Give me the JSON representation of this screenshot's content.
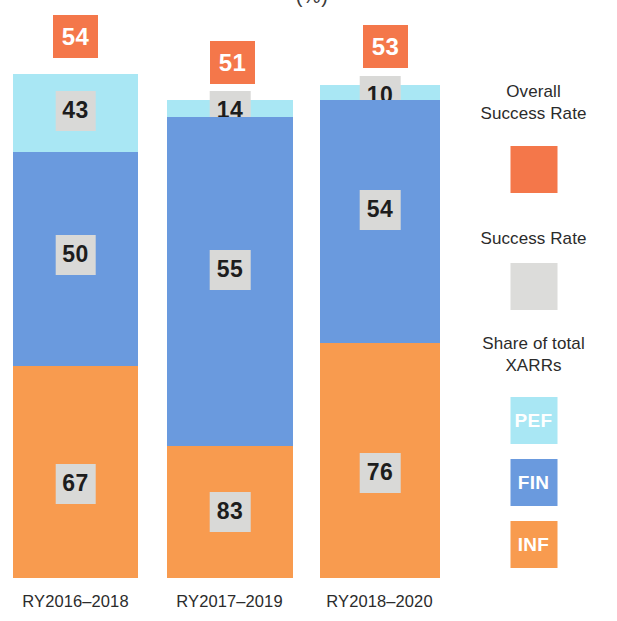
{
  "chart_data": {
    "type": "bar",
    "title": "(%)",
    "subtitle": "",
    "xlabel": "",
    "ylabel": "",
    "stacked": false,
    "grid": false,
    "legend_position": "right",
    "categories": [
      "RY2016–2018",
      "RY2017–2019",
      "RY2018–2020"
    ],
    "series": [
      {
        "name": "PEF",
        "label": "PEF",
        "color": "#a9e7f4",
        "values": [
          43,
          14,
          10
        ]
      },
      {
        "name": "FIN",
        "label": "FIN",
        "color": "#6a9ade",
        "values": [
          50,
          55,
          54
        ]
      },
      {
        "name": "INF",
        "label": "INF",
        "color": "#f89b4f",
        "values": [
          67,
          83,
          76
        ]
      }
    ],
    "overall_success_rate": {
      "name": "Overall Success Rate",
      "color": "#f4774a",
      "values": [
        54,
        51,
        53
      ]
    },
    "annotations": {
      "value_chip_background": "#d9d9d7",
      "note": "Each bar is split vertically into PEF / FIN / INF bands whose heights encode the share of total XARRs; the number inside each band is that band's success rate (%)."
    },
    "ylim": [
      0,
      100
    ]
  },
  "bars": [
    {
      "category": "RY2016–2018",
      "overall": "54",
      "overall_chip": {
        "left": 53,
        "top": 15
      },
      "geom": {
        "left": 13,
        "width": 125,
        "top": 74,
        "bottom": 578
      },
      "segments": [
        {
          "key": "pef",
          "value": "43",
          "top": 74,
          "height": 78,
          "chip_offset": 17
        },
        {
          "key": "fin",
          "value": "50",
          "top": 152,
          "height": 214,
          "chip_offset": 83
        },
        {
          "key": "inf",
          "value": "67",
          "top": 366,
          "height": 212,
          "chip_offset": 98
        }
      ]
    },
    {
      "category": "RY2017–2019",
      "overall": "51",
      "overall_chip": {
        "left": 210,
        "top": 41
      },
      "geom": {
        "left": 167,
        "width": 126,
        "top": 100,
        "bottom": 578
      },
      "segments": [
        {
          "key": "pef",
          "value": "14",
          "top": 100,
          "height": 17,
          "chip_offset": -9
        },
        {
          "key": "fin",
          "value": "55",
          "top": 117,
          "height": 329,
          "chip_offset": 133
        },
        {
          "key": "inf",
          "value": "83",
          "top": 446,
          "height": 132,
          "chip_offset": 46
        }
      ]
    },
    {
      "category": "RY2018–2020",
      "overall": "53",
      "overall_chip": {
        "left": 363,
        "top": 25
      },
      "geom": {
        "left": 320,
        "width": 120,
        "top": 85,
        "bottom": 578
      },
      "segments": [
        {
          "key": "pef",
          "value": "10",
          "top": 85,
          "height": 15,
          "chip_offset": -9
        },
        {
          "key": "fin",
          "value": "54",
          "top": 100,
          "height": 243,
          "chip_offset": 90
        },
        {
          "key": "inf",
          "value": "76",
          "top": 343,
          "height": 235,
          "chip_offset": 110
        }
      ]
    }
  ],
  "xlabels": [
    {
      "text": "RY2016–2018",
      "left": 3,
      "width": 145
    },
    {
      "text": "RY2017–2019",
      "left": 157,
      "width": 145
    },
    {
      "text": "RY2018–2020",
      "left": 307,
      "width": 145
    }
  ],
  "legend": {
    "overall": {
      "line1": "Overall",
      "line2": "Success Rate",
      "text_top": 81,
      "swatch_top": 146,
      "color": "#f4774a"
    },
    "success_rate": {
      "line1": "Success Rate",
      "text_top": 228,
      "swatch_top": 263,
      "color": "#dcdcda"
    },
    "share": {
      "line1": "Share of total",
      "line2": "XARRs",
      "text_top": 333,
      "items": [
        {
          "label": "PEF",
          "color": "#a9e7f4",
          "swatch_top": 397
        },
        {
          "label": "FIN",
          "color": "#6a9ade",
          "swatch_top": 459
        },
        {
          "label": "INF",
          "color": "#f89b4f",
          "swatch_top": 521
        }
      ]
    }
  }
}
